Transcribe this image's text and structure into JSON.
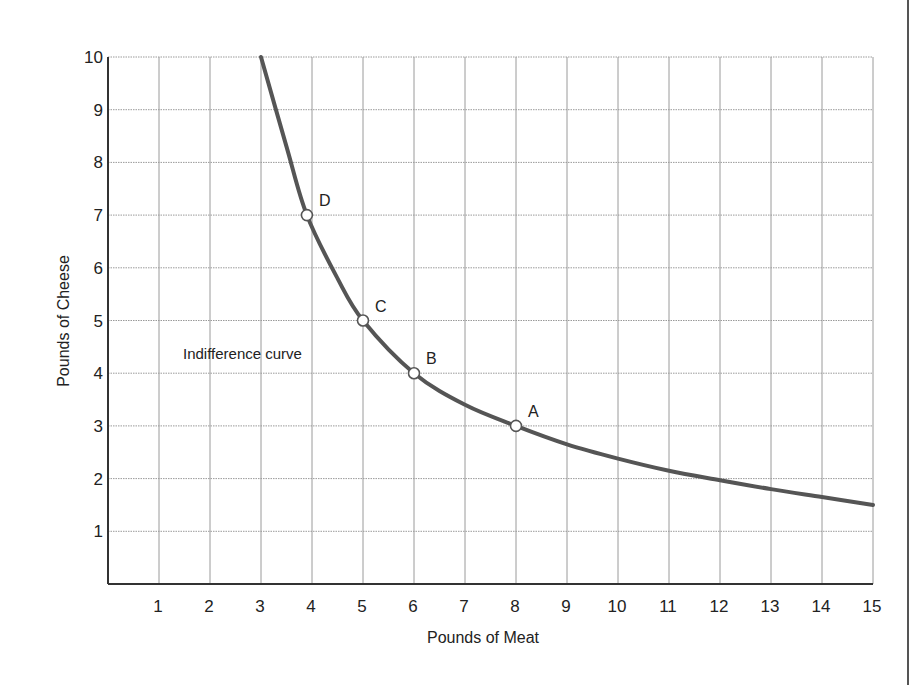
{
  "chart_data": {
    "type": "line",
    "title": "",
    "xlabel": "Pounds of Meat",
    "ylabel": "Pounds of Cheese",
    "xlim": [
      0,
      15
    ],
    "ylim": [
      0,
      10
    ],
    "x_ticks": [
      1,
      2,
      3,
      4,
      5,
      6,
      7,
      8,
      9,
      10,
      11,
      12,
      13,
      14,
      15
    ],
    "y_ticks": [
      1,
      2,
      3,
      4,
      5,
      6,
      7,
      8,
      9,
      10
    ],
    "grid": true,
    "legend": null,
    "series": [
      {
        "name": "Indifference curve",
        "x": [
          3,
          3.5,
          3.9,
          4.5,
          5,
          6,
          7,
          8,
          9,
          10,
          11,
          12,
          13,
          14,
          15
        ],
        "y": [
          10,
          8.3,
          7,
          5.8,
          5,
          4,
          3.4,
          3,
          2.65,
          2.38,
          2.15,
          1.97,
          1.8,
          1.65,
          1.5
        ],
        "color": "#555555"
      }
    ],
    "points": [
      {
        "label": "D",
        "x": 3.9,
        "y": 7
      },
      {
        "label": "C",
        "x": 5,
        "y": 5
      },
      {
        "label": "B",
        "x": 6,
        "y": 4
      },
      {
        "label": "A",
        "x": 8,
        "y": 3
      }
    ],
    "annotations": [
      {
        "text": "Indifference curve",
        "x": 1.5,
        "y": 4.4
      }
    ]
  },
  "labels": {
    "x_axis_title": "Pounds of Meat",
    "y_axis_title": "Pounds of Cheese",
    "curve_annotation": "Indifference curve",
    "point_a": "A",
    "point_b": "B",
    "point_c": "C",
    "point_d": "D",
    "x_ticks": [
      "1",
      "2",
      "3",
      "4",
      "5",
      "6",
      "7",
      "8",
      "9",
      "10",
      "11",
      "12",
      "13",
      "14",
      "15"
    ],
    "y_ticks": [
      "1",
      "2",
      "3",
      "4",
      "5",
      "6",
      "7",
      "8",
      "9",
      "10"
    ]
  },
  "colors": {
    "curve": "#555555",
    "grid": "#9a9a9a",
    "axis": "#333333",
    "text": "#222222",
    "background": "#ffffff"
  }
}
